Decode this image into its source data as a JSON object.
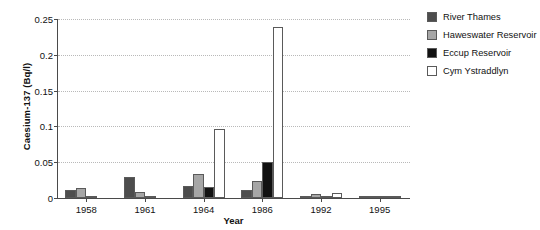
{
  "chart_data": {
    "type": "bar",
    "title": "",
    "xlabel": "Year",
    "ylabel": "Caesium-137 (Bq/l)",
    "categories": [
      "1958",
      "1961",
      "1964",
      "1986",
      "1992",
      "1995"
    ],
    "series": [
      {
        "name": "River Thames",
        "color": "#4d4d4d",
        "values": [
          0.011,
          0.029,
          0.017,
          0.011,
          0.003,
          0.002
        ]
      },
      {
        "name": "Haweswater Reservoir",
        "color": "#a6a6a6",
        "values": [
          0.014,
          0.009,
          0.034,
          0.024,
          0.005,
          0.003
        ]
      },
      {
        "name": "Eccup Reservoir",
        "color": "#111111",
        "values": [
          0.002,
          0.003,
          0.015,
          0.05,
          0.002,
          0.003
        ]
      },
      {
        "name": "Cym Ystraddlyn",
        "color": "#ffffff",
        "values": [
          0.0,
          0.0,
          0.096,
          0.239,
          0.007,
          0.002
        ]
      }
    ],
    "ylim": [
      0,
      0.25
    ],
    "yticks": [
      0,
      0.05,
      0.1,
      0.15,
      0.2,
      0.25
    ],
    "ytick_labels": [
      "0",
      "0.05",
      "0.1",
      "0.15",
      "0.2",
      "0.25"
    ],
    "grid": "horizontal-dotted",
    "legend_position": "right",
    "bar_edge_color": "#5a5a5a"
  },
  "legend": {
    "entries": [
      {
        "label": "River Thames"
      },
      {
        "label": "Haweswater Reservoir"
      },
      {
        "label": "Eccup Reservoir"
      },
      {
        "label": "Cym Ystraddlyn"
      }
    ]
  }
}
